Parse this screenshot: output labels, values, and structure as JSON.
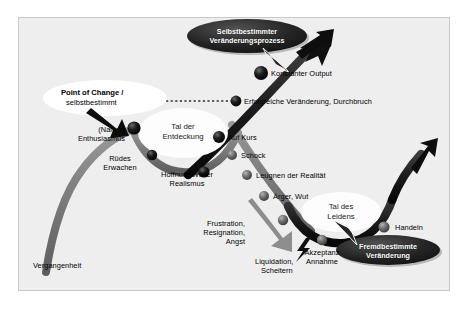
{
  "diagram": {
    "title_bubbles": [
      {
        "id": "selbstbestimmter",
        "line1": "Selbstbestimmter",
        "line2": "Veränderungsprozess",
        "color": "#2b2b2b"
      },
      {
        "id": "fremdbestimmte",
        "line1": "Fremdbestimmte",
        "line2": "Veränderung",
        "color": "#2b2b2b"
      }
    ],
    "callout": {
      "line1": "Point of Change /",
      "line2": "selbstbestimmt"
    },
    "valleys": [
      {
        "id": "tal-der-entdeckung",
        "line1": "Tal der",
        "line2": "Entdeckung"
      },
      {
        "id": "tal-des-leidens",
        "line1": "Tal des",
        "line2": "Leidens"
      }
    ],
    "stage_labels": [
      {
        "id": "vergangenheit",
        "text": "Vergangenheit"
      },
      {
        "id": "naiver-enthusiasmus",
        "line1": "(Naiver)",
        "line2": "Enthusiasmus"
      },
      {
        "id": "ruedes-erwachen",
        "line1": "Rüdes",
        "line2": "Erwachen"
      },
      {
        "id": "hoffnungsvoller-realismus",
        "line1": "Hoffnungsvoller",
        "line2": "Realismus"
      },
      {
        "id": "auf-kurs",
        "text": "Auf Kurs"
      },
      {
        "id": "erfolgreiche-veraenderung",
        "text": "Erfolgreiche Veränderung, Durchbruch"
      },
      {
        "id": "konstanter-output",
        "text": "Konstanter Output"
      },
      {
        "id": "schock",
        "text": "Schock"
      },
      {
        "id": "leugnen-der-realitaet",
        "text": "Leugnen der Realität"
      },
      {
        "id": "aerger-wut",
        "text": "Ärger, Wut"
      },
      {
        "id": "frustration",
        "line1": "Frustration,",
        "line2": "Resignation,",
        "line3": "Angst"
      },
      {
        "id": "liquidation",
        "line1": "Liquidation,",
        "line2": "Scheitern"
      },
      {
        "id": "akzeptanz",
        "line1": "Akzeptanz",
        "line2": "Annahme"
      },
      {
        "id": "handeln",
        "text": "Handeln"
      }
    ],
    "colors": {
      "background": "#eeeeee",
      "frame_border": "#c9c9c9",
      "curve_gray": "#7f7f7f",
      "curve_dark": "#1c1c1c",
      "node_dark": "#111111",
      "node_gray": "#6e6e6e",
      "bubble_fill": "#2b2b2b",
      "callout_fill": "#ffffff",
      "valley_fill": "#fdfdfd"
    }
  }
}
